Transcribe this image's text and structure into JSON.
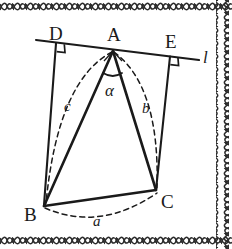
{
  "figure": {
    "background_color": "#ffffff",
    "ink_color": "#1a1a1a",
    "border": {
      "style": "braided-rope",
      "sides": [
        "top",
        "right",
        "bottom"
      ],
      "color": "#2b2b2b"
    },
    "points": {
      "A": {
        "label": "A",
        "x": 113,
        "y": 50
      },
      "B": {
        "label": "B",
        "x": 43,
        "y": 207
      },
      "C": {
        "label": "C",
        "x": 155,
        "y": 191
      },
      "D": {
        "label": "D",
        "x": 56,
        "y": 43
      },
      "E": {
        "label": "E",
        "x": 171,
        "y": 58
      }
    },
    "line_label": {
      "label": "l",
      "x": 203,
      "y": 58
    },
    "angle": {
      "label": "α",
      "vertex": "A",
      "x": 110,
      "y": 97
    },
    "side_labels": [
      {
        "label": "a",
        "opposite_vertex": "A",
        "between": "B-C",
        "x": 97,
        "y": 222
      },
      {
        "label": "b",
        "opposite_vertex": "B",
        "between": "A-C",
        "x": 146,
        "y": 110
      },
      {
        "label": "c",
        "opposite_vertex": "C",
        "between": "A-B",
        "x": 68,
        "y": 107
      }
    ],
    "right_angles": [
      {
        "at": "D",
        "between": "l and DB"
      },
      {
        "at": "E",
        "between": "l and EC"
      }
    ],
    "solid_segments": [
      {
        "from": "l-left",
        "to": "l-right",
        "name": "line-l"
      },
      {
        "from": "A",
        "to": "B",
        "name": "segment-ab"
      },
      {
        "from": "A",
        "to": "C",
        "name": "segment-ac"
      },
      {
        "from": "B",
        "to": "C",
        "name": "segment-bc"
      },
      {
        "from": "D",
        "to": "B",
        "name": "segment-db"
      },
      {
        "from": "E",
        "to": "C",
        "name": "segment-ec"
      }
    ],
    "dashed_arcs": [
      {
        "name": "arc-c",
        "from": "A",
        "to": "B"
      },
      {
        "name": "arc-b",
        "from": "A",
        "to": "C"
      },
      {
        "name": "arc-a",
        "from": "B",
        "to": "C"
      }
    ]
  }
}
